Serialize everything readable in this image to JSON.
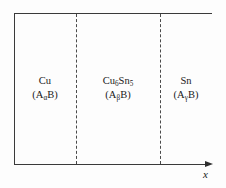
{
  "figure": {
    "type": "schematic-diagram",
    "background_color": "#fdfdfd",
    "line_color": "#3a3a3a",
    "text_color": "#1a1a1a"
  },
  "axis": {
    "x_label": "x",
    "x_label_style": "italic",
    "arrow_direction": "right"
  },
  "regions": [
    {
      "id": "cu",
      "name_main": "Cu",
      "name_sub": "",
      "name_tail": "",
      "formula_prefix": "(A",
      "formula_sub": "α",
      "formula_suffix": "B)"
    },
    {
      "id": "cu6sn5",
      "name_main": "Cu",
      "name_sub": "6",
      "name_tail": "Sn",
      "name_sub2": "5",
      "formula_prefix": "(A",
      "formula_sub": "β",
      "formula_suffix": "B)"
    },
    {
      "id": "sn",
      "name_main": "Sn",
      "name_sub": "",
      "name_tail": "",
      "formula_prefix": "(A",
      "formula_sub": "γ",
      "formula_suffix": "B)"
    }
  ],
  "interfaces": [
    {
      "id": "interface-1",
      "style": "dashed"
    },
    {
      "id": "interface-2",
      "style": "dashed"
    }
  ]
}
